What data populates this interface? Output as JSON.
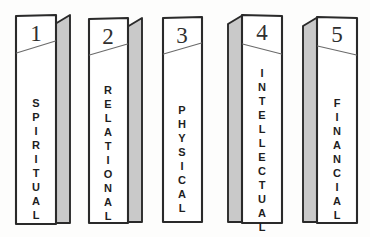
{
  "diagram": {
    "background_color": "#fdfdfc",
    "ink_color": "#2a2a2a",
    "shade_color": "#c9c9c9",
    "style": "hand-drawn pencil sketch, isometric pillars",
    "pillars": [
      {
        "number": "1",
        "label": "SPIRITUAL",
        "letters": [
          "S",
          "P",
          "I",
          "R",
          "I",
          "T",
          "U",
          "A",
          "L"
        ],
        "shade_side": "right"
      },
      {
        "number": "2",
        "label": "RELATIONAL",
        "letters": [
          "R",
          "E",
          "L",
          "A",
          "T",
          "I",
          "O",
          "N",
          "A",
          "L"
        ],
        "shade_side": "right"
      },
      {
        "number": "3",
        "label": "PHYSICAL",
        "letters": [
          "P",
          "H",
          "Y",
          "S",
          "I",
          "C",
          "A",
          "L"
        ],
        "shade_side": "none"
      },
      {
        "number": "4",
        "label": "INTELLECTUAL",
        "letters": [
          "I",
          "N",
          "T",
          "E",
          "L",
          "L",
          "E",
          "C",
          "T",
          "U",
          "A",
          "L"
        ],
        "shade_side": "left"
      },
      {
        "number": "5",
        "label": "FINANCIAL",
        "letters": [
          "F",
          "I",
          "N",
          "A",
          "N",
          "C",
          "I",
          "A",
          "L"
        ],
        "shade_side": "left"
      }
    ]
  }
}
